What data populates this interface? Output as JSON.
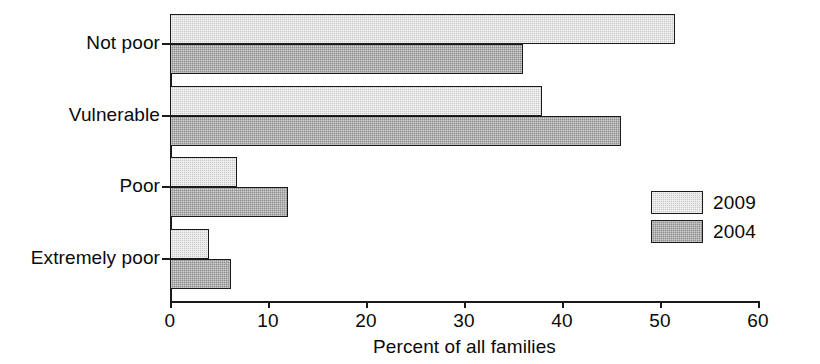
{
  "chart_data": {
    "type": "bar",
    "orientation": "horizontal",
    "title": "",
    "subtitle": "",
    "xlabel": "Percent of all families",
    "ylabel": "",
    "xlim": [
      0,
      60
    ],
    "xticks": [
      0,
      10,
      20,
      30,
      40,
      50,
      60
    ],
    "xtick_labels": [
      "0",
      "10",
      "20",
      "30",
      "40",
      "50",
      "60"
    ],
    "grid": false,
    "legend_position": "center-right",
    "categories": [
      "Not poor",
      "Vulnerable",
      "Poor",
      "Extremely poor"
    ],
    "series": [
      {
        "name": "2009",
        "color": "#c9c9c9",
        "values": [
          51.5,
          38.0,
          6.8,
          4.0
        ]
      },
      {
        "name": "2004",
        "color": "#8e8e8e",
        "values": [
          36.0,
          46.0,
          12.0,
          6.2
        ]
      }
    ]
  },
  "legend": {
    "entries": [
      {
        "label": "2009",
        "swatch": "light-gray-swatch"
      },
      {
        "label": "2004",
        "swatch": "dark-gray-swatch"
      }
    ]
  },
  "axis": {
    "x_title": "Percent of all families"
  }
}
